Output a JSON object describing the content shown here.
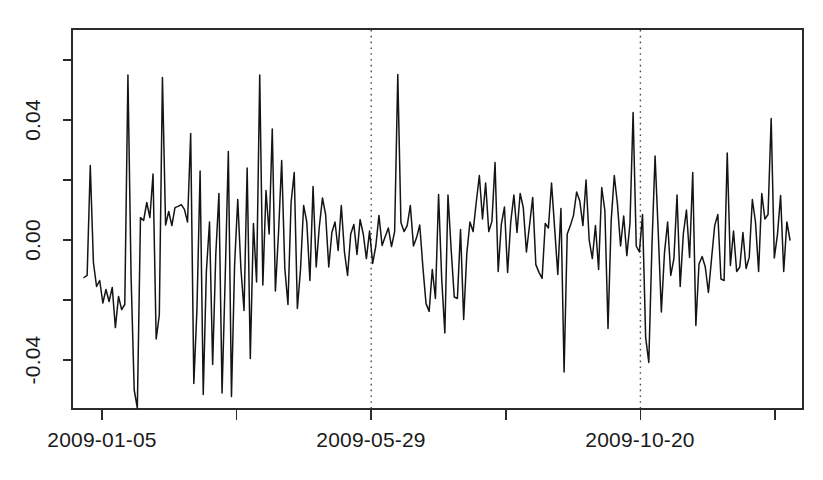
{
  "chart_data": {
    "type": "line",
    "title": "",
    "subtitle": "",
    "xlabel": "",
    "ylabel": "",
    "grid": false,
    "legend": false,
    "legend_position": "none",
    "xlim": [
      0,
      248
    ],
    "ylim": [
      -0.06,
      0.058
    ],
    "yticks_labeled": [
      "0.04",
      "0.00",
      "-0.04"
    ],
    "ytick_values_labeled": [
      0.04,
      0.0,
      -0.04
    ],
    "ytick_values_all": [
      0.06,
      0.04,
      0.02,
      0.0,
      -0.02,
      -0.04
    ],
    "xticks_labels": [
      "2009-01-05",
      "",
      "2009-05-29",
      "",
      "2009-10-20",
      ""
    ],
    "xtick_index_positions": [
      3,
      28,
      52,
      78,
      102,
      128
    ],
    "annotations": [
      {
        "type": "vline",
        "label": "2009-05-29",
        "x_index": 101,
        "style": "dotted"
      },
      {
        "type": "vline",
        "label": "2009-10-20",
        "x_index": 174,
        "style": "dotted"
      }
    ],
    "series": [
      {
        "name": "daily-return",
        "color": "#141414",
        "values": [
          -0.0125,
          -0.0118,
          0.0248,
          -0.0075,
          -0.0155,
          -0.0135,
          -0.021,
          -0.0165,
          -0.0205,
          -0.0158,
          -0.0292,
          -0.0188,
          -0.0232,
          -0.0215,
          0.055,
          -0.012,
          -0.05,
          -0.056,
          0.0075,
          0.0065,
          0.0125,
          0.0075,
          0.022,
          -0.033,
          -0.025,
          0.0542,
          0.005,
          0.0095,
          0.0048,
          0.0108,
          0.0112,
          0.0118,
          0.0102,
          0.006,
          0.0355,
          -0.0478,
          -0.023,
          0.023,
          -0.0515,
          -0.0105,
          0.006,
          -0.0415,
          -0.0048,
          0.0155,
          -0.051,
          -0.0125,
          0.0295,
          -0.0522,
          -0.0082,
          0.0135,
          -0.0095,
          -0.0235,
          0.024,
          -0.0395,
          0.0055,
          -0.014,
          0.055,
          -0.015,
          0.0165,
          0.002,
          0.037,
          -0.017,
          0.0025,
          0.0265,
          -0.0095,
          -0.0215,
          0.0125,
          0.0225,
          -0.0228,
          -0.0098,
          0.0115,
          0.006,
          -0.0135,
          0.0178,
          -0.009,
          0.0045,
          0.014,
          0.0085,
          -0.009,
          0.0025,
          0.006,
          -0.0035,
          0.0115,
          -0.004,
          -0.0118,
          0.002,
          0.0052,
          -0.0048,
          0.0068,
          0.002,
          -0.0062,
          0.003,
          -0.0078,
          -0.002,
          0.0082,
          -0.0018,
          0.0012,
          0.004,
          -0.0022,
          0.0028,
          0.0552,
          0.0058,
          0.0028,
          0.0048,
          0.0115,
          -0.002,
          0.0008,
          0.005,
          -0.009,
          -0.0212,
          -0.0238,
          -0.0098,
          -0.0195,
          0.0152,
          -0.013,
          -0.031,
          0.015,
          -0.003,
          -0.019,
          -0.0195,
          0.0035,
          -0.0265,
          -0.0045,
          0.006,
          0.0028,
          0.0125,
          0.0215,
          0.007,
          0.019,
          0.0028,
          0.0062,
          0.0258,
          -0.0105,
          0.0052,
          0.011,
          -0.0108,
          0.006,
          0.015,
          0.0025,
          0.0155,
          0.0108,
          -0.004,
          0.005,
          0.0142,
          -0.0082,
          -0.0108,
          -0.0128,
          0.0055,
          0.004,
          0.019,
          0.0038,
          -0.0115,
          0.0105,
          -0.044,
          0.002,
          0.0048,
          0.0082,
          0.016,
          0.013,
          0.0048,
          0.02,
          0.0,
          -0.0062,
          0.0048,
          -0.0098,
          0.0175,
          0.0098,
          -0.0295,
          0.0062,
          0.0215,
          0.012,
          -0.002,
          0.008,
          -0.0052,
          0.0055,
          0.0425,
          -0.002,
          -0.004,
          0.0085,
          -0.0325,
          -0.0408,
          -0.002,
          0.028,
          0.0028,
          -0.024,
          -0.0042,
          0.006,
          -0.0118,
          -0.0062,
          0.015,
          -0.0155,
          0.002,
          0.01,
          -0.0058,
          0.0225,
          -0.0285,
          -0.008,
          -0.0055,
          -0.009,
          -0.0175,
          -0.0062,
          0.0048,
          0.0085,
          -0.013,
          -0.0135,
          0.029,
          -0.0085,
          0.003,
          -0.0105,
          -0.009,
          0.0025,
          -0.0095,
          -0.0058,
          0.0135,
          0.006,
          -0.0105,
          0.0155,
          0.007,
          0.0085,
          0.0405,
          -0.006,
          0.0018,
          0.0148,
          -0.0105,
          0.006,
          0.0
        ]
      }
    ]
  },
  "axis": {
    "y_tick_labels": [
      "0.04",
      "0.00",
      "-0.04"
    ],
    "x_tick_labels": [
      "2009-01-05",
      "2009-05-29",
      "2009-10-20"
    ]
  }
}
